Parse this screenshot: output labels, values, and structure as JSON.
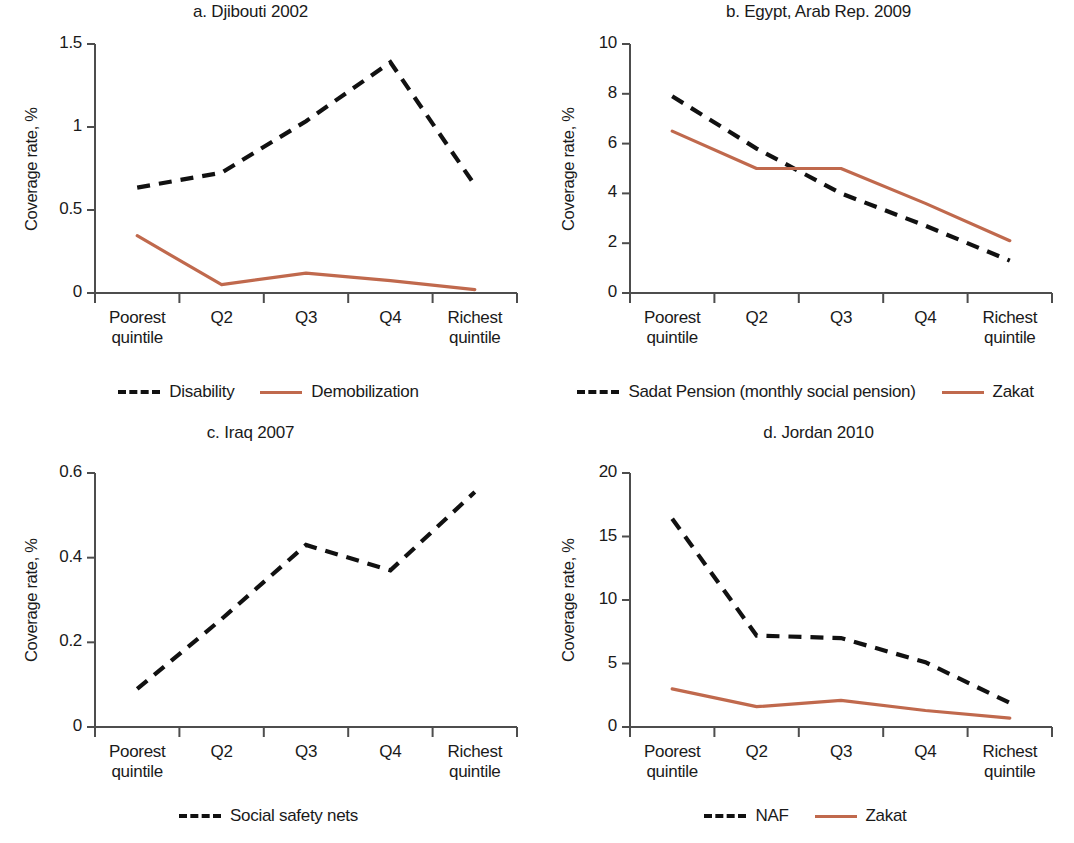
{
  "figure": {
    "ylabel": "Coverage rate, %",
    "categories": [
      "Poorest quintile",
      "Q2",
      "Q3",
      "Q4",
      "Richest quintile"
    ],
    "colors": {
      "dashed_series": "#111111",
      "solid_series": "#c0694d",
      "axis": "#4d4d4d",
      "text": "#1a1a1a"
    }
  },
  "chart_data": [
    {
      "type": "line",
      "panel": "a",
      "title": "a. Djibouti 2002",
      "xlabel": "",
      "ylabel": "Coverage rate, %",
      "categories": [
        "Poorest quintile",
        "Q2",
        "Q3",
        "Q4",
        "Richest quintile"
      ],
      "ylim": [
        0,
        1.5
      ],
      "yticks": [
        0,
        0.5,
        1,
        1.5
      ],
      "ytick_labels": [
        "0",
        "0.5",
        "1",
        "1.5"
      ],
      "grid": false,
      "legend_position": "bottom",
      "series": [
        {
          "name": "Disability",
          "style": "dashed",
          "color": "#111111",
          "values": [
            0.635,
            0.725,
            1.035,
            1.39,
            0.65
          ]
        },
        {
          "name": "Demobilization",
          "style": "solid",
          "color": "#c0694d",
          "values": [
            0.345,
            0.05,
            0.12,
            0.075,
            0.02
          ]
        }
      ]
    },
    {
      "type": "line",
      "panel": "b",
      "title": "b. Egypt, Arab Rep. 2009",
      "xlabel": "",
      "ylabel": "Coverage rate, %",
      "categories": [
        "Poorest quintile",
        "Q2",
        "Q3",
        "Q4",
        "Richest quintile"
      ],
      "ylim": [
        0,
        10
      ],
      "yticks": [
        0,
        2,
        4,
        6,
        8,
        10
      ],
      "ytick_labels": [
        "0",
        "2",
        "4",
        "6",
        "8",
        "10"
      ],
      "grid": false,
      "legend_position": "bottom",
      "series": [
        {
          "name": "Sadat Pension (monthly social pension)",
          "style": "dashed",
          "color": "#111111",
          "values": [
            7.9,
            5.8,
            4.0,
            2.7,
            1.3
          ]
        },
        {
          "name": "Zakat",
          "style": "solid",
          "color": "#c0694d",
          "values": [
            6.5,
            5.0,
            5.0,
            3.6,
            2.1
          ]
        }
      ]
    },
    {
      "type": "line",
      "panel": "c",
      "title": "c. Iraq 2007",
      "xlabel": "",
      "ylabel": "Coverage rate, %",
      "categories": [
        "Poorest quintile",
        "Q2",
        "Q3",
        "Q4",
        "Richest quintile"
      ],
      "ylim": [
        0,
        0.6
      ],
      "yticks": [
        0,
        0.2,
        0.4,
        0.6
      ],
      "ytick_labels": [
        "0",
        "0.2",
        "0.4",
        "0.6"
      ],
      "grid": false,
      "legend_position": "bottom",
      "series": [
        {
          "name": "Social safety nets",
          "style": "dashed",
          "color": "#111111",
          "values": [
            0.09,
            0.255,
            0.43,
            0.37,
            0.555
          ]
        }
      ]
    },
    {
      "type": "line",
      "panel": "d",
      "title": "d. Jordan 2010",
      "xlabel": "",
      "ylabel": "Coverage rate, %",
      "categories": [
        "Poorest quintile",
        "Q2",
        "Q3",
        "Q4",
        "Richest quintile"
      ],
      "ylim": [
        0,
        20
      ],
      "yticks": [
        0,
        5,
        10,
        15,
        20
      ],
      "ytick_labels": [
        "0",
        "5",
        "10",
        "15",
        "20"
      ],
      "grid": false,
      "legend_position": "bottom",
      "series": [
        {
          "name": "NAF",
          "style": "dashed",
          "color": "#111111",
          "values": [
            16.4,
            7.2,
            7.0,
            5.1,
            1.9
          ]
        },
        {
          "name": "Zakat",
          "style": "solid",
          "color": "#c0694d",
          "values": [
            3.0,
            1.6,
            2.1,
            1.3,
            0.7
          ]
        }
      ]
    }
  ]
}
